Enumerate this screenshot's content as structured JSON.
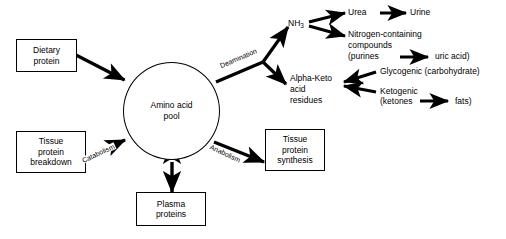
{
  "diagram": {
    "background_color": "#ffffff",
    "line_color": "#000000",
    "center": {
      "name": "amino-acid-pool",
      "line1": "Amino acid",
      "line2": "pool"
    },
    "boxes": [
      {
        "id": "dietary-protein",
        "line1": "Dietary",
        "line2": "protein",
        "line3": ""
      },
      {
        "id": "tissue-protein-breakdown",
        "line1": "Tissue",
        "line2": "protein",
        "line3": "breakdown"
      },
      {
        "id": "plasma-proteins",
        "line1": "Plasma",
        "line2": "proteins",
        "line3": ""
      },
      {
        "id": "tissue-protein-synthesis",
        "line1": "Tissue",
        "line2": "protein",
        "line3": "synthesis"
      }
    ],
    "edge_labels": [
      {
        "id": "deamination",
        "text": "Deamination"
      },
      {
        "id": "catabolism",
        "text": "Catabolism"
      },
      {
        "id": "anabolism",
        "text": "Anabolism"
      }
    ],
    "products": {
      "ammonia": {
        "label": "NH",
        "subscript": "3"
      },
      "urea": "Urea",
      "urine": "Urine",
      "nitrogen_compounds_line1": "Nitrogen-containing",
      "nitrogen_compounds_line2": "compounds",
      "nitrogen_compounds_line3": "(purines",
      "uric_acid": "uric acid)",
      "alpha_keto_line1": "Alpha-Keto",
      "alpha_keto_line2": "acid",
      "alpha_keto_line3": "residues",
      "glycogenic": "Glycogenic (carbohydrate)",
      "ketogenic_line1": "Ketogenic",
      "ketogenic_line2": "(ketones",
      "fats": "fats)"
    }
  }
}
